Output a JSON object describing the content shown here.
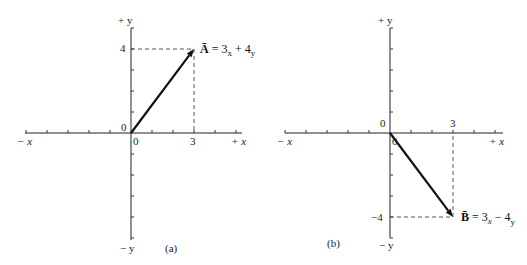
{
  "figure": {
    "panels": [
      {
        "id": "a",
        "caption": "(a)",
        "axis_labels": {
          "pos_x": "+ x",
          "neg_x": "− x",
          "pos_y": "+ y",
          "neg_y": "− y"
        },
        "tick_labels": {
          "origin_y": "0",
          "origin_x": "0",
          "x_mark": "3",
          "y_mark": "4"
        },
        "vector": {
          "name": "A",
          "from": [
            0,
            0
          ],
          "to": [
            3,
            4
          ],
          "label_parts": {
            "symbol": "Ā",
            "eq": " = 3",
            "sub_x": "x",
            "plus": " + 4",
            "sub_y": "y"
          }
        },
        "x_ticks_range": [
          -6,
          5
        ],
        "y_ticks_range": [
          -5,
          5
        ]
      },
      {
        "id": "b",
        "caption": "(b)",
        "axis_labels": {
          "pos_x": "+ x",
          "neg_x": "− x",
          "pos_y": "+ y",
          "neg_y": "− y"
        },
        "tick_labels": {
          "origin_y": "0",
          "origin_x": "0",
          "x_mark": "3",
          "y_mark": "−4"
        },
        "vector": {
          "name": "B",
          "from": [
            0,
            0
          ],
          "to": [
            3,
            -4
          ],
          "label_parts": {
            "symbol": "B̄",
            "eq": " = 3",
            "sub_x": "x",
            "plus": " − 4",
            "sub_y": "y"
          }
        },
        "x_ticks_range": [
          -6,
          5
        ],
        "y_ticks_range": [
          -5,
          5
        ]
      }
    ]
  }
}
